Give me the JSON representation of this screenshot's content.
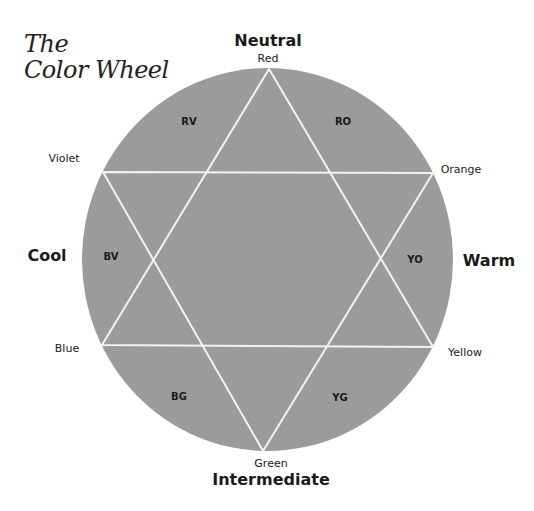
{
  "title": {
    "line1": "The",
    "line2": "Color Wheel"
  },
  "wheel": {
    "fill_color": "#9b9b9b",
    "line_color": "#f2f2f2",
    "primaries": {
      "top": "Red",
      "upper_left": "Violet",
      "upper_right": "Orange",
      "lower_left": "Blue",
      "lower_right": "Yellow",
      "bottom": "Green"
    },
    "segments": {
      "rv": "RV",
      "ro": "RO",
      "bv": "BV",
      "yo": "YO",
      "bg": "BG",
      "yg": "YG"
    }
  },
  "categories": {
    "top": "Neutral",
    "left": "Cool",
    "right": "Warm",
    "bottom": "Intermediate"
  }
}
